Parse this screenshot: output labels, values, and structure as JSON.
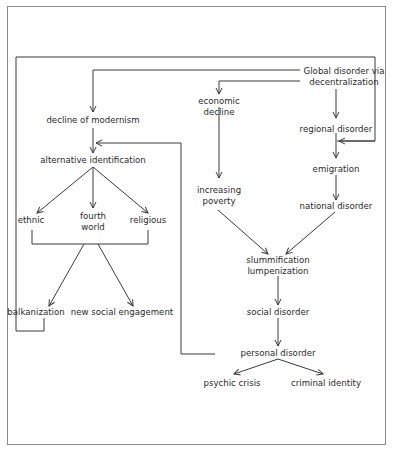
{
  "diagram": {
    "nodes": {
      "global_disorder_line1": "Global disorder via",
      "global_disorder_line2": "decentralization",
      "decline_of_modernism": "decline of modernism",
      "alternative_identification": "alternative identification",
      "ethnic": "ethnic",
      "fourth_world_line1": "fourth",
      "fourth_world_line2": "world",
      "religious": "religious",
      "balkanization": "balkanization",
      "new_social_engagement": "new social engagement",
      "economic_decline_line1": "economic",
      "economic_decline_line2": "decline",
      "regional_disorder": "regional disorder",
      "emigration": "emigration",
      "increasing_poverty_line1": "increasing",
      "increasing_poverty_line2": "poverty",
      "national_disorder": "national disorder",
      "slummification": "slummification",
      "lumpenization": "lumpenization",
      "social_disorder": "social disorder",
      "personal_disorder": "personal disorder",
      "psychic_crisis": "psychic crisis",
      "criminal_identity": "criminal identity"
    },
    "colors": {
      "line": "#3a3a3a",
      "frame": "#8a8a8a",
      "text": "#2a2a2a"
    }
  }
}
